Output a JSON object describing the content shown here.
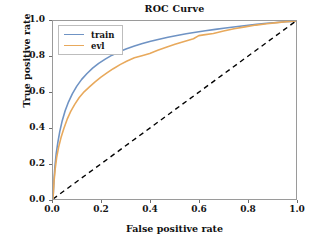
{
  "chart_data": {
    "type": "line",
    "title": "ROC Curve",
    "xlabel": "False positive rate",
    "ylabel": "True positive rate",
    "xlim": [
      0.0,
      1.0
    ],
    "ylim": [
      0.0,
      1.0
    ],
    "grid": false,
    "legend_position": "upper left",
    "xticks": [
      "0.0",
      "0.2",
      "0.4",
      "0.6",
      "0.8",
      "1.0"
    ],
    "xtickvalues": [
      0.0,
      0.2,
      0.4,
      0.6,
      0.8,
      1.0
    ],
    "yticks": [
      "0.0",
      "0.2",
      "0.4",
      "0.6",
      "0.8",
      "1.0"
    ],
    "ytickvalues": [
      0.0,
      0.2,
      0.4,
      0.6,
      0.8,
      1.0
    ],
    "colors": {
      "train": "#6f93c4",
      "evl": "#e8a95c",
      "chance": "#000000",
      "frame": "#9a9a9a",
      "background": "#ffffff"
    },
    "series": [
      {
        "name": "train",
        "color": "#6f93c4",
        "linestyle": "solid",
        "x": [
          0.0,
          0.004,
          0.008,
          0.013,
          0.02,
          0.028,
          0.038,
          0.05,
          0.064,
          0.08,
          0.098,
          0.118,
          0.14,
          0.163,
          0.188,
          0.215,
          0.243,
          0.272,
          0.303,
          0.335,
          0.368,
          0.402,
          0.437,
          0.473,
          0.51,
          0.548,
          0.587,
          0.627,
          0.668,
          0.71,
          0.752,
          0.795,
          0.838,
          0.88,
          0.92,
          0.955,
          0.98,
          1.0
        ],
        "y": [
          0.0,
          0.105,
          0.185,
          0.253,
          0.318,
          0.38,
          0.44,
          0.496,
          0.546,
          0.592,
          0.634,
          0.672,
          0.705,
          0.735,
          0.762,
          0.786,
          0.808,
          0.827,
          0.844,
          0.859,
          0.873,
          0.886,
          0.898,
          0.909,
          0.919,
          0.928,
          0.937,
          0.945,
          0.953,
          0.961,
          0.968,
          0.975,
          0.981,
          0.987,
          0.992,
          0.996,
          0.998,
          1.0
        ]
      },
      {
        "name": "evl",
        "color": "#e8a95c",
        "linestyle": "solid",
        "x": [
          0.0,
          0.004,
          0.009,
          0.015,
          0.023,
          0.033,
          0.045,
          0.058,
          0.073,
          0.09,
          0.108,
          0.128,
          0.15,
          0.172,
          0.196,
          0.222,
          0.248,
          0.276,
          0.305,
          0.335,
          0.366,
          0.398,
          0.431,
          0.466,
          0.502,
          0.54,
          0.578,
          0.6,
          0.62,
          0.66,
          0.702,
          0.745,
          0.79,
          0.835,
          0.88,
          0.922,
          0.96,
          0.985,
          1.0
        ],
        "y": [
          0.0,
          0.095,
          0.168,
          0.232,
          0.29,
          0.345,
          0.398,
          0.447,
          0.492,
          0.533,
          0.57,
          0.602,
          0.63,
          0.657,
          0.683,
          0.708,
          0.732,
          0.755,
          0.775,
          0.793,
          0.805,
          0.818,
          0.836,
          0.853,
          0.869,
          0.885,
          0.9,
          0.918,
          0.922,
          0.93,
          0.944,
          0.956,
          0.967,
          0.977,
          0.985,
          0.991,
          0.996,
          0.999,
          1.0
        ]
      },
      {
        "name": "chance",
        "color": "#000000",
        "linestyle": "dashed",
        "x": [
          0.0,
          1.0
        ],
        "y": [
          0.0,
          1.0
        ]
      }
    ],
    "legend": [
      {
        "label": "train",
        "color": "#6f93c4"
      },
      {
        "label": "evl",
        "color": "#e8a95c"
      }
    ]
  }
}
